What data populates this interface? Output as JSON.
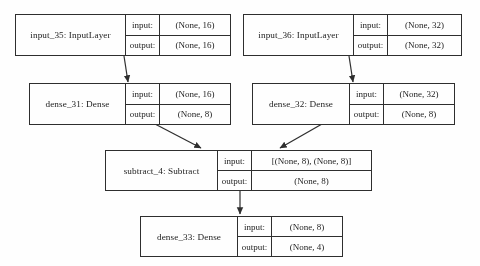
{
  "diagram": {
    "type": "neural-network-layer-graph",
    "labels": {
      "input": "input:",
      "output": "output:"
    },
    "nodes": [
      {
        "id": "input_35",
        "name": "input_35: InputLayer",
        "input_shape": "(None, 16)",
        "output_shape": "(None, 16)"
      },
      {
        "id": "input_36",
        "name": "input_36: InputLayer",
        "input_shape": "(None, 32)",
        "output_shape": "(None, 32)"
      },
      {
        "id": "dense_31",
        "name": "dense_31: Dense",
        "input_shape": "(None, 16)",
        "output_shape": "(None, 8)"
      },
      {
        "id": "dense_32",
        "name": "dense_32: Dense",
        "input_shape": "(None, 32)",
        "output_shape": "(None, 8)"
      },
      {
        "id": "subtract_4",
        "name": "subtract_4: Subtract",
        "input_shape": "[(None, 8), (None, 8)]",
        "output_shape": "(None, 8)"
      },
      {
        "id": "dense_33",
        "name": "dense_33: Dense",
        "input_shape": "(None, 8)",
        "output_shape": "(None, 4)"
      }
    ],
    "edges": [
      {
        "from": "input_35",
        "to": "dense_31"
      },
      {
        "from": "input_36",
        "to": "dense_32"
      },
      {
        "from": "dense_31",
        "to": "subtract_4"
      },
      {
        "from": "dense_32",
        "to": "subtract_4"
      },
      {
        "from": "subtract_4",
        "to": "dense_33"
      }
    ],
    "colors": {
      "stroke": "#2b2b2b",
      "text": "#1a1a1a",
      "background": "#ffffff"
    }
  }
}
